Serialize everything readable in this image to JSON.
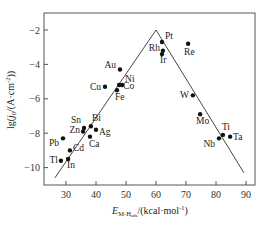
{
  "chart_data": {
    "type": "scatter",
    "title": "",
    "xlabel": "E_M-H_ads/(kcal·mol⁻¹)",
    "ylabel": "lg(j0/(A·cm⁻²))",
    "xlabel_parts": {
      "E": "E",
      "sub": "M-H",
      "subsub": "ads",
      "unit": "/(kcal·mol",
      "sup": "-1",
      "close": ")"
    },
    "ylabel_parts": {
      "pre": "lg(",
      "j": "j",
      "sub": "0",
      "mid": "/(A·cm",
      "sup": "-2",
      "close": "))"
    },
    "xlim": [
      22,
      92
    ],
    "ylim": [
      -11,
      -1
    ],
    "xticks": [
      30,
      40,
      50,
      60,
      70,
      80,
      90
    ],
    "yticks": [
      -2,
      -4,
      -6,
      -8,
      -10
    ],
    "grid": false,
    "legend": null,
    "points": [
      {
        "label": "Pt",
        "x": 62.0,
        "y": -2.7
      },
      {
        "label": "Rh",
        "x": 62.3,
        "y": -3.2
      },
      {
        "label": "Ir",
        "x": 62.0,
        "y": -3.4
      },
      {
        "label": "Re",
        "x": 70.7,
        "y": -2.8
      },
      {
        "label": "Au",
        "x": 48.0,
        "y": -4.3
      },
      {
        "label": "Ni",
        "x": 48.7,
        "y": -5.2
      },
      {
        "label": "Co",
        "x": 47.7,
        "y": -5.2
      },
      {
        "label": "Fe",
        "x": 47.0,
        "y": -5.5
      },
      {
        "label": "Cu",
        "x": 43.0,
        "y": -5.3
      },
      {
        "label": "W",
        "x": 72.3,
        "y": -5.8
      },
      {
        "label": "Mo",
        "x": 74.7,
        "y": -6.9
      },
      {
        "label": "Ti",
        "x": 82.3,
        "y": -8.1
      },
      {
        "label": "Ta",
        "x": 84.7,
        "y": -8.2
      },
      {
        "label": "Nb",
        "x": 81.0,
        "y": -8.3
      },
      {
        "label": "Sn",
        "x": 36.0,
        "y": -7.7
      },
      {
        "label": "Zn",
        "x": 35.7,
        "y": -7.9
      },
      {
        "label": "Bi",
        "x": 38.3,
        "y": -7.6
      },
      {
        "label": "Ag",
        "x": 40.0,
        "y": -7.8
      },
      {
        "label": "Ca",
        "x": 38.0,
        "y": -8.2
      },
      {
        "label": "Pb",
        "x": 29.0,
        "y": -8.3
      },
      {
        "label": "Cd",
        "x": 31.3,
        "y": -9.0
      },
      {
        "label": "Tl",
        "x": 28.3,
        "y": -9.6
      },
      {
        "label": "In",
        "x": 30.7,
        "y": -9.5
      }
    ],
    "volcano_lines": [
      {
        "name": "left-branch",
        "from": [
          26.3,
          -10.6
        ],
        "to": [
          60.0,
          -2.0
        ]
      },
      {
        "name": "right-branch",
        "from": [
          60.0,
          -2.0
        ],
        "to": [
          89.3,
          -10.3
        ]
      }
    ]
  }
}
